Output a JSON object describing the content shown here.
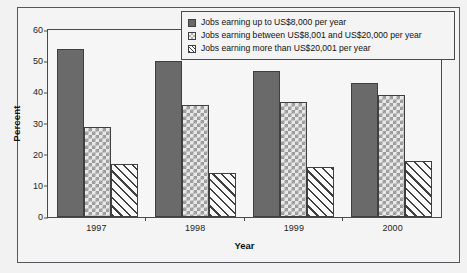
{
  "chart_data": {
    "type": "bar",
    "title": "",
    "subtitle": "",
    "xlabel": "Year",
    "ylabel": "Percent",
    "categories": [
      "1997",
      "1998",
      "1999",
      "2000"
    ],
    "series": [
      {
        "name": "Jobs earning up to US$8,000 per year",
        "pattern": "solid-gray",
        "color": "#6a6a6a",
        "values": [
          54,
          50,
          47,
          43
        ]
      },
      {
        "name": "Jobs earning between US$8,001 and US$20,000 per year",
        "pattern": "checkerboard",
        "color": "#e9e9e9",
        "values": [
          29,
          36,
          37,
          39
        ]
      },
      {
        "name": "Jobs earning more than US$20,001 per year",
        "pattern": "diagonal-hatch",
        "color": "#fafafa",
        "values": [
          17,
          14,
          16,
          18
        ]
      }
    ],
    "ylim": [
      0,
      60
    ],
    "yticks": [
      0,
      10,
      20,
      30,
      40,
      50,
      60
    ],
    "ytick_labels": [
      "0",
      "10",
      "20",
      "30",
      "40",
      "50",
      "60"
    ],
    "grid": false,
    "legend_position": "top-right"
  }
}
